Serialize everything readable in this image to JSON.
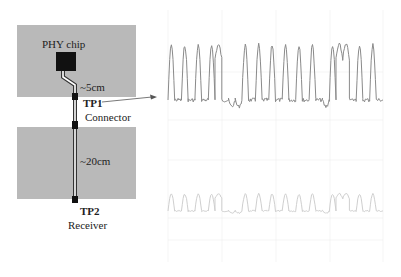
{
  "diagram": {
    "colors": {
      "board": "#b9b9b9",
      "chip": "#111111",
      "trace": "#333333",
      "trace_gap": "#ffffff",
      "waveform_top": "#8a8a8a",
      "waveform_bottom": "#cfcfcf",
      "grid": "#eeeeee",
      "arrow": "#555555"
    },
    "boards": [
      {
        "name": "source-board",
        "x": 17,
        "y": 25,
        "w": 119,
        "h": 72
      },
      {
        "name": "receiver-board",
        "x": 17,
        "y": 127,
        "w": 119,
        "h": 72
      }
    ],
    "chip": {
      "label": "PHY chip",
      "x": 56,
      "y": 52,
      "w": 20,
      "h": 19
    },
    "labels": {
      "trace1_length": "~5cm",
      "trace2_length": "~20cm",
      "tp1": "TP1",
      "tp1_sub": "Connector",
      "tp2": "TP2",
      "tp2_sub": "Receiver"
    },
    "waveforms": {
      "top": {
        "name": "TP1 waveform",
        "x0": 168,
        "x1": 383,
        "baseline": 100,
        "high": 45,
        "bits": [
          1,
          0,
          1,
          0,
          1,
          0,
          1,
          1,
          0,
          0,
          0,
          1,
          0,
          1,
          0,
          1,
          0,
          1,
          0,
          1,
          0,
          1,
          0,
          0,
          1,
          1,
          1,
          0,
          1,
          0,
          1,
          0
        ]
      },
      "bottom": {
        "name": "TP2 waveform",
        "x0": 168,
        "x1": 383,
        "baseline": 211,
        "high": 194,
        "bits": [
          1,
          0,
          1,
          0,
          1,
          0,
          1,
          1,
          0,
          0,
          0,
          1,
          0,
          1,
          0,
          1,
          0,
          1,
          0,
          1,
          0,
          1,
          0,
          0,
          1,
          1,
          1,
          0,
          1,
          0,
          1,
          0
        ]
      }
    }
  }
}
